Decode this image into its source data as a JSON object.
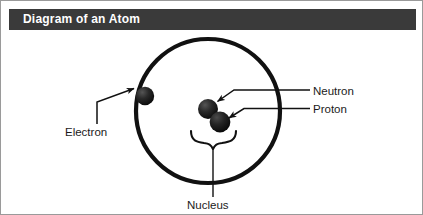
{
  "figure": {
    "title": "Diagram of an Atom",
    "width": 423,
    "height": 215,
    "background_color": "#ffffff",
    "border_color": "#9a9a9a"
  },
  "title_bar": {
    "label": "Diagram of an Atom",
    "background_color": "#3a3a3a",
    "text_color": "#ffffff"
  },
  "diagram": {
    "type": "labeled-schematic",
    "subject": "atom",
    "ink_color": "#111111",
    "orbit": {
      "name": "electron-orbit",
      "shape": "circle",
      "center_x": 207,
      "center_y": 110,
      "radius": 72,
      "stroke_width": 4
    },
    "particles": [
      {
        "name": "electron",
        "label": "Electron",
        "center_x": 144,
        "center_y": 95,
        "radius": 9,
        "color": "#171717"
      },
      {
        "name": "neutron",
        "label": "Neutron",
        "center_x": 207,
        "center_y": 108,
        "radius": 10,
        "color": "#2b2b2b"
      },
      {
        "name": "proton",
        "label": "Proton",
        "center_x": 219,
        "center_y": 121,
        "radius": 10,
        "color": "#1c1c1c"
      }
    ],
    "nucleus": {
      "name": "nucleus",
      "label": "Nucleus",
      "brace_left_x": 190,
      "brace_right_x": 236,
      "brace_y": 136,
      "leader_x": 212,
      "leader_top_y": 148,
      "leader_bottom_y": 196
    }
  },
  "labels": {
    "electron": "Electron",
    "neutron": "Neutron",
    "proton": "Proton",
    "nucleus": "Nucleus"
  },
  "leader_lines": [
    {
      "name": "electron-leader",
      "from_label": "Electron",
      "path": "M 96 123 L 96 100 L 135 88",
      "arrow_at": [
        135,
        88
      ]
    },
    {
      "name": "neutron-leader",
      "from_label": "Neutron",
      "path": "M 308 89 L 232 89 L 215 100",
      "arrow_at": [
        215,
        100
      ]
    },
    {
      "name": "proton-leader",
      "from_label": "Proton",
      "path": "M 308 107 L 241 107 L 226 117",
      "arrow_at": [
        226,
        117
      ]
    }
  ]
}
